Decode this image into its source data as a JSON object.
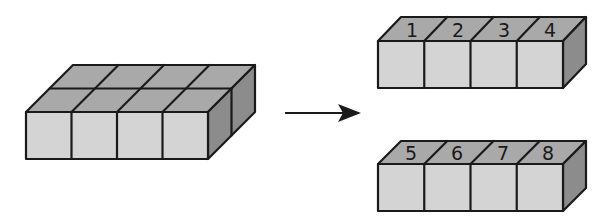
{
  "diagram": {
    "colors": {
      "front_face": "#d4d4d4",
      "top_face": "#a9a9a9",
      "side_face": "#8c8c8c",
      "stroke": "#1a1a1a"
    },
    "source_block": {
      "rows": 2,
      "columns": 4,
      "cube_count": 8
    },
    "arrow": {
      "direction": "right"
    },
    "result_rows": [
      {
        "labels": [
          "1",
          "2",
          "3",
          "4"
        ]
      },
      {
        "labels": [
          "5",
          "6",
          "7",
          "8"
        ]
      }
    ]
  }
}
